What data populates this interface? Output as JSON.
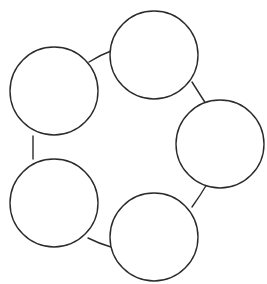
{
  "canvas": {
    "width": 267,
    "height": 284,
    "background_color": "#ffffff",
    "stroke_color": "#2b2b2b",
    "stroke_width": 1.4,
    "node_fill_color": "#ffffff"
  },
  "diagram": {
    "kind": "cycle-diagram",
    "shape": "hexagonal-ring",
    "node_count": 6,
    "link_count": 6,
    "node_radius": 44,
    "has_labels": false,
    "has_arrowheads": false,
    "title": "",
    "nodes": [
      {
        "id": "node-1",
        "position": "top",
        "cx": 154,
        "cy": 55,
        "r": 44,
        "label": ""
      },
      {
        "id": "node-2",
        "position": "upper-right",
        "cx": 220,
        "cy": 144,
        "r": 44,
        "label": ""
      },
      {
        "id": "node-3",
        "position": "lower-right",
        "cx": 154,
        "cy": 237,
        "r": 44,
        "label": ""
      },
      {
        "id": "node-4",
        "position": "lower-left",
        "cx": 54,
        "cy": 203,
        "r": 44,
        "label": ""
      },
      {
        "id": "node-5",
        "position": "upper-left",
        "cx": 54,
        "cy": 91,
        "r": 44,
        "label": ""
      },
      {
        "id": "node-6",
        "position": "top-left-arc",
        "cx": 154,
        "cy": 55,
        "r": 44,
        "label": ""
      }
    ],
    "links": [
      {
        "id": "link-upperleft-top",
        "from": "upper-left",
        "to": "top",
        "d": "M 89 62 Q 100 55 111 51"
      },
      {
        "id": "link-top-upperright",
        "from": "top",
        "to": "upper-right",
        "d": "M 192 82 Q 199 93 206 104"
      },
      {
        "id": "link-upperright-lowerright",
        "from": "upper-right",
        "to": "lower-right",
        "d": "M 207 184 Q 200 196 192 207"
      },
      {
        "id": "link-lowerright-lowerleft",
        "from": "lower-right",
        "to": "lower-left",
        "d": "M 111 247 Q 100 244 88 238"
      },
      {
        "id": "link-lowerleft-upperleft",
        "from": "lower-left",
        "to": "upper-left",
        "d": "M 33 159 L 33 136"
      },
      {
        "id": "link-upperleft-inner",
        "from": "upper-left",
        "to": "top-inner",
        "d": "M 89 62 Q 100 55 111 51"
      }
    ]
  }
}
